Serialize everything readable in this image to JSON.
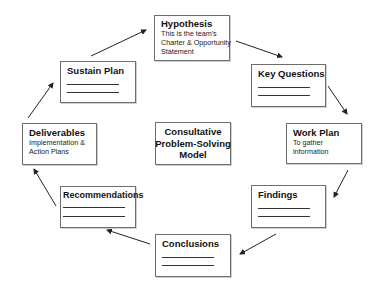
{
  "diagram": {
    "center": {
      "lines": [
        "Consultative",
        "Problem-Solving",
        "Model"
      ]
    },
    "nodes": [
      {
        "id": "hypothesis",
        "title": "Hypothesis",
        "desc": [
          "This is the team's",
          "Charter & Opportunity",
          "Statement"
        ]
      },
      {
        "id": "key-questions",
        "title": "Key Questions",
        "desc": []
      },
      {
        "id": "work-plan",
        "title": "Work Plan",
        "desc": [
          "To gather",
          "information"
        ]
      },
      {
        "id": "findings",
        "title": "Findings",
        "desc": []
      },
      {
        "id": "conclusions",
        "title": "Conclusions",
        "desc": []
      },
      {
        "id": "recommendations",
        "title": "Recommendations",
        "desc": []
      },
      {
        "id": "deliverables",
        "title": "Deliverables",
        "desc": [
          "Implementation &",
          "Action Plans"
        ]
      },
      {
        "id": "sustain-plan",
        "title": "Sustain Plan",
        "desc": []
      }
    ],
    "edges": [
      {
        "from": "hypothesis",
        "to": "key-questions"
      },
      {
        "from": "key-questions",
        "to": "work-plan"
      },
      {
        "from": "work-plan",
        "to": "findings"
      },
      {
        "from": "findings",
        "to": "conclusions"
      },
      {
        "from": "conclusions",
        "to": "recommendations"
      },
      {
        "from": "recommendations",
        "to": "deliverables"
      },
      {
        "from": "deliverables",
        "to": "sustain-plan"
      },
      {
        "from": "sustain-plan",
        "to": "hypothesis"
      }
    ],
    "colors": {
      "border": "#6e6e6e",
      "arrow": "#222222",
      "text": "#111111"
    }
  }
}
